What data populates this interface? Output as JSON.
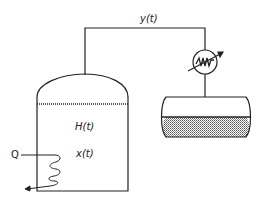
{
  "diagram": {
    "type": "process-flow",
    "labels": {
      "vapor": "y(t)",
      "holdup": "H(t)",
      "composition": "x(t)",
      "heat": "Q"
    },
    "components": [
      {
        "id": "still-pot",
        "name": "Still pot (reboiler)"
      },
      {
        "id": "heating-coil",
        "name": "Heating coil"
      },
      {
        "id": "vapor-line",
        "name": "Overhead vapor line"
      },
      {
        "id": "condenser",
        "name": "Condenser / heat exchanger"
      },
      {
        "id": "accumulator",
        "name": "Distillate accumulator drum"
      }
    ],
    "colors": {
      "line": "#222222",
      "liquid_fill": "#bdbdbd",
      "background": "#ffffff"
    }
  }
}
